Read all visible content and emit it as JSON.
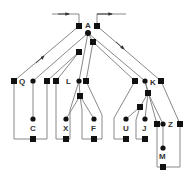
{
  "diagram": {
    "type": "tree",
    "labels": {
      "A": "A",
      "Q": "Q",
      "L": "L",
      "K": "K",
      "C": "C",
      "X": "X",
      "F": "F",
      "U": "U",
      "J": "J",
      "Z": "Z",
      "M": "M"
    },
    "colors": {
      "line": "#7a7a7a",
      "node": "#111111",
      "label": "#333333"
    }
  }
}
